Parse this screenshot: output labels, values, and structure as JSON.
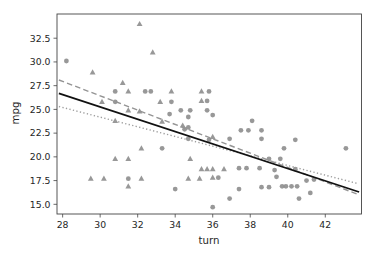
{
  "window": {
    "background": "#ffffff"
  },
  "chart_data": {
    "type": "scatter",
    "title": "",
    "xlabel": "turn",
    "ylabel": "mpg",
    "xlim": [
      27.7,
      43.93
    ],
    "ylim": [
      13.98,
      35.05
    ],
    "xticks": [
      28,
      30,
      32,
      34,
      36,
      38,
      40,
      42
    ],
    "yticks": [
      15.0,
      17.5,
      20.0,
      22.5,
      25.0,
      27.5,
      30.0,
      32.5
    ],
    "grid": false,
    "legend": "none",
    "spine_color": "#444444",
    "tick_label_color": "#262626",
    "series": [
      {
        "name": "circle-markers",
        "marker": "circle",
        "color": "#8a8a8a",
        "points": [
          [
            28.2,
            30.1
          ],
          [
            30.8,
            26.9
          ],
          [
            32.4,
            26.9
          ],
          [
            32.7,
            26.9
          ],
          [
            35.8,
            26.9
          ],
          [
            30.8,
            25.8
          ],
          [
            33.8,
            25.8
          ],
          [
            35.7,
            25.9
          ],
          [
            34.3,
            24.9
          ],
          [
            34.8,
            24.9
          ],
          [
            35.7,
            24.9
          ],
          [
            36.0,
            24.4
          ],
          [
            34.7,
            24.2
          ],
          [
            33.7,
            24.5
          ],
          [
            38.1,
            23.8
          ],
          [
            37.5,
            22.8
          ],
          [
            37.9,
            22.8
          ],
          [
            38.6,
            22.8
          ],
          [
            34.5,
            22.9
          ],
          [
            34.7,
            23.1
          ],
          [
            34.7,
            21.9
          ],
          [
            35.8,
            21.8
          ],
          [
            36.9,
            21.9
          ],
          [
            38.6,
            21.9
          ],
          [
            40.4,
            21.8
          ],
          [
            33.3,
            20.9
          ],
          [
            39.8,
            20.9
          ],
          [
            43.1,
            20.9
          ],
          [
            39.0,
            19.8
          ],
          [
            39.6,
            19.8
          ],
          [
            37.4,
            18.8
          ],
          [
            37.8,
            18.8
          ],
          [
            38.5,
            18.8
          ],
          [
            39.3,
            18.6
          ],
          [
            40.4,
            18.7
          ],
          [
            31.5,
            17.7
          ],
          [
            36.3,
            17.8
          ],
          [
            39.4,
            17.9
          ],
          [
            41.0,
            17.5
          ],
          [
            41.4,
            17.6
          ],
          [
            34.0,
            16.6
          ],
          [
            37.4,
            16.6
          ],
          [
            38.6,
            16.8
          ],
          [
            39.0,
            16.8
          ],
          [
            39.7,
            16.9
          ],
          [
            39.9,
            16.9
          ],
          [
            40.2,
            16.9
          ],
          [
            40.5,
            16.9
          ],
          [
            41.2,
            16.2
          ],
          [
            40.6,
            15.6
          ],
          [
            36.9,
            15.6
          ],
          [
            36.0,
            14.7
          ]
        ]
      },
      {
        "name": "triangle-markers",
        "marker": "triangle",
        "color": "#8a8a8a",
        "points": [
          [
            32.1,
            34.0
          ],
          [
            32.8,
            31.0
          ],
          [
            29.6,
            28.9
          ],
          [
            31.2,
            27.8
          ],
          [
            31.5,
            26.9
          ],
          [
            33.8,
            26.9
          ],
          [
            35.4,
            26.9
          ],
          [
            30.1,
            25.8
          ],
          [
            33.2,
            25.8
          ],
          [
            35.4,
            25.9
          ],
          [
            31.5,
            24.9
          ],
          [
            32.1,
            24.8
          ],
          [
            30.8,
            23.8
          ],
          [
            33.3,
            23.7
          ],
          [
            34.4,
            23.3
          ],
          [
            36.0,
            22.1
          ],
          [
            32.2,
            20.9
          ],
          [
            30.8,
            19.8
          ],
          [
            31.5,
            19.8
          ],
          [
            34.8,
            19.8
          ],
          [
            35.4,
            18.7
          ],
          [
            35.7,
            18.7
          ],
          [
            36.0,
            18.7
          ],
          [
            36.6,
            18.7
          ],
          [
            29.5,
            17.7
          ],
          [
            30.2,
            17.7
          ],
          [
            32.2,
            17.7
          ],
          [
            34.7,
            17.7
          ],
          [
            35.3,
            17.7
          ],
          [
            36.0,
            17.8
          ],
          [
            31.5,
            16.9
          ]
        ]
      }
    ],
    "fit_lines": [
      {
        "name": "dashed-fit-line",
        "style": "dashed",
        "color": "#949494",
        "width": 1.4,
        "x": [
          27.8,
          43.8
        ],
        "y": [
          28.1,
          16.0
        ]
      },
      {
        "name": "dotted-fit-line",
        "style": "dotted",
        "color": "#9e9e9e",
        "width": 1.4,
        "x": [
          27.8,
          43.7
        ],
        "y": [
          25.3,
          17.2
        ]
      },
      {
        "name": "solid-fit-line",
        "style": "solid",
        "color": "#111111",
        "width": 1.8,
        "x": [
          27.8,
          43.8
        ],
        "y": [
          26.7,
          16.3
        ]
      }
    ]
  }
}
